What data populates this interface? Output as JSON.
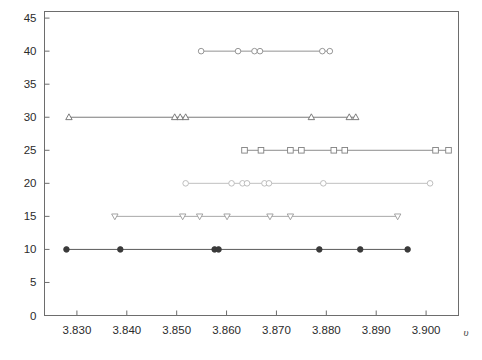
{
  "chart_data": {
    "type": "scatter",
    "title": "",
    "subtitle": "",
    "xlabel": "υ",
    "ylabel": "",
    "xlim": [
      3.8235,
      3.9065
    ],
    "ylim": [
      0,
      46
    ],
    "grid": false,
    "legend": "none",
    "x_ticks": [
      3.83,
      3.84,
      3.85,
      3.86,
      3.87,
      3.88,
      3.89,
      3.9
    ],
    "x_tick_labels": [
      "3.830",
      "3.840",
      "3.850",
      "3.860",
      "3.870",
      "3.880",
      "3.890",
      "3.900"
    ],
    "y_ticks": [
      0,
      5,
      10,
      15,
      20,
      25,
      30,
      35,
      40,
      45
    ],
    "y_tick_labels": [
      "0",
      "5",
      "10",
      "15",
      "20",
      "25",
      "30",
      "35",
      "40",
      "45"
    ],
    "series": [
      {
        "name": "level-10",
        "y": 10,
        "marker": "filled-circle",
        "color": "#3a3a3a",
        "line_color": "#5a5a5a",
        "x": [
          3.8279,
          3.8387,
          3.8576,
          3.8584,
          3.8786,
          3.8868,
          3.8963
        ],
        "range": [
          3.8279,
          3.8963
        ]
      },
      {
        "name": "level-15",
        "y": 15,
        "marker": "down-triangle",
        "color": "#9a9a9a",
        "line_color": "#a8a8a8",
        "x": [
          3.8376,
          3.8512,
          3.8546,
          3.8601,
          3.8687,
          3.8728,
          3.8943
        ],
        "range": [
          3.8376,
          3.8943
        ]
      },
      {
        "name": "level-20",
        "y": 20,
        "marker": "open-circle",
        "color": "#b7b7b7",
        "line_color": "#c0c0c0",
        "x": [
          3.8518,
          3.861,
          3.8632,
          3.8641,
          3.8676,
          3.8685,
          3.8794,
          3.9008
        ],
        "range": [
          3.8518,
          3.9008
        ]
      },
      {
        "name": "level-25",
        "y": 25,
        "marker": "open-square",
        "color": "#808080",
        "line_color": "#8d8d8d",
        "x": [
          3.8636,
          3.8669,
          3.8728,
          3.875,
          3.8815,
          3.8837,
          3.9019,
          3.9045
        ],
        "range": [
          3.8636,
          3.9045
        ]
      },
      {
        "name": "level-30",
        "y": 30,
        "marker": "up-triangle",
        "color": "#6e6e6e",
        "line_color": "#7b7b7b",
        "x": [
          3.8284,
          3.8496,
          3.8507,
          3.8518,
          3.877,
          3.8846,
          3.8859
        ],
        "range": [
          3.8284,
          3.8859
        ]
      },
      {
        "name": "level-40",
        "y": 40,
        "marker": "open-circle",
        "color": "#8a8a8a",
        "line_color": "#939393",
        "x": [
          3.8549,
          3.8623,
          3.8656,
          3.8667,
          3.8792,
          3.8807
        ],
        "range": [
          3.8549,
          3.8807
        ]
      }
    ]
  }
}
